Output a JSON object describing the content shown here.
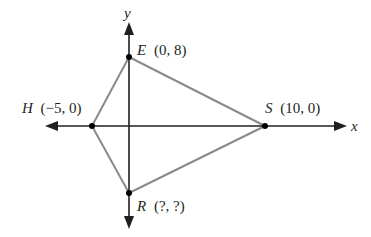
{
  "diagram": {
    "type": "coordinate-plane-quadrilateral",
    "axes": {
      "x_label": "x",
      "y_label": "y"
    },
    "points": [
      {
        "name": "E",
        "coords": "(0, 8)",
        "x": 0,
        "y": 8
      },
      {
        "name": "H",
        "coords": "(−5, 0)",
        "x": -5,
        "y": 0
      },
      {
        "name": "S",
        "coords": "(10, 0)",
        "x": 10,
        "y": 0
      },
      {
        "name": "R",
        "coords": "(?, ?)",
        "x": null,
        "y": null
      }
    ],
    "edges": [
      "E-S",
      "S-R",
      "R-H",
      "H-E"
    ],
    "colors": {
      "axis": "#231f20",
      "edge": "#8a8a8a",
      "point": "#000000"
    }
  }
}
